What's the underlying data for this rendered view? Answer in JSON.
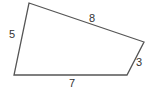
{
  "diagram": {
    "type": "quadrilateral",
    "stroke_color": "#555555",
    "label_color": "#333333",
    "vertices": [
      {
        "name": "top-left",
        "x": 29,
        "y": 3
      },
      {
        "name": "right",
        "x": 144,
        "y": 42
      },
      {
        "name": "bottom-right",
        "x": 127,
        "y": 75
      },
      {
        "name": "bottom-left",
        "x": 14,
        "y": 75
      }
    ],
    "sides": [
      {
        "name": "left",
        "label": "5",
        "label_x": 9,
        "label_y": 38
      },
      {
        "name": "top",
        "label": "8",
        "label_x": 89,
        "label_y": 22
      },
      {
        "name": "right",
        "label": "3",
        "label_x": 136,
        "label_y": 66
      },
      {
        "name": "bottom",
        "label": "7",
        "label_x": 69,
        "label_y": 87
      }
    ]
  }
}
